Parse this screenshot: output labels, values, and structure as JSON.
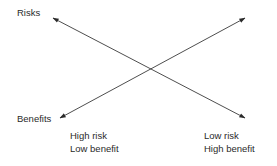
{
  "diagram": {
    "axis_labels": {
      "top": "Risks",
      "bottom": "Benefits"
    },
    "arrows": [
      {
        "name": "risks-arrow",
        "from": "bottom-right",
        "to": "top-left",
        "meaning": "Risks"
      },
      {
        "name": "benefits-arrow",
        "from": "top-right",
        "to": "bottom-left",
        "meaning": "Benefits"
      }
    ],
    "annotations": {
      "left": {
        "line1": "High risk",
        "line2": "Low benefit"
      },
      "right": {
        "line1": "Low risk",
        "line2": "High benefit"
      }
    },
    "colors": {
      "line": "#3a3a3a",
      "text": "#2a2a2a",
      "background": "#ffffff"
    }
  }
}
